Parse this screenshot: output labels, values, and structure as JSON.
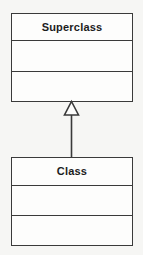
{
  "diagram": {
    "type": "uml-class-diagram",
    "background_color": "#f6f6f4",
    "line_color": "#3a3a3a",
    "text_color": "#1c1c1c",
    "classes": [
      {
        "id": "superclass",
        "name": "Superclass",
        "attributes": [],
        "operations": [],
        "compartment_count": 3
      },
      {
        "id": "class",
        "name": "Class",
        "attributes": [],
        "operations": [],
        "compartment_count": 3
      }
    ],
    "relationships": [
      {
        "type": "generalization",
        "from": "Class",
        "to": "Superclass",
        "arrow_head": "hollow-triangle",
        "line_style": "solid"
      }
    ]
  }
}
